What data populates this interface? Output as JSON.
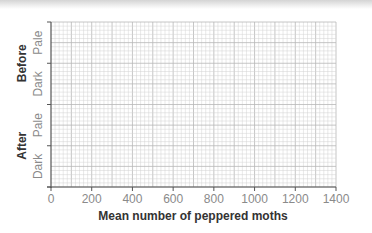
{
  "chart_data": {
    "type": "bar",
    "orientation": "horizontal",
    "title": "",
    "xlabel": "Mean number of peppered moths",
    "ylabel": "",
    "xlim": [
      0,
      1400
    ],
    "x_ticks": [
      0,
      200,
      400,
      600,
      800,
      1000,
      1200,
      1400
    ],
    "x_tick_labels": [
      "0",
      "200",
      "400",
      "600",
      "800",
      "1000",
      "1200",
      "1400"
    ],
    "grid": true,
    "grid_minor_step": 20,
    "groups": [
      {
        "name": "Before",
        "categories": [
          "Pale",
          "Dark"
        ]
      },
      {
        "name": "After",
        "categories": [
          "Pale",
          "Dark"
        ]
      }
    ],
    "categories": [
      "Before Pale",
      "Before Dark",
      "After Pale",
      "After Dark"
    ],
    "values": [
      null,
      null,
      null,
      null
    ],
    "note": "Blank graph-paper grid; no data bars plotted",
    "legend": null
  },
  "colors": {
    "grid_minor": "#d2d2d2",
    "grid_major": "#b8b8b8",
    "axis": "#555555",
    "tick_text": "#8a8a8a",
    "title_text": "#333333"
  }
}
